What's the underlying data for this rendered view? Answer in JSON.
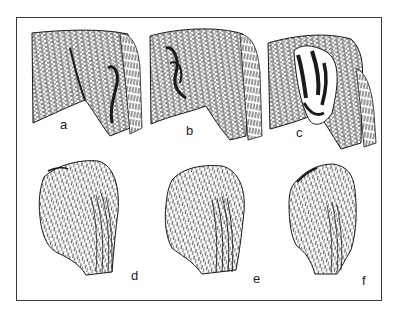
{
  "figure": {
    "panels": [
      {
        "id": "a",
        "label": "a",
        "view": "side",
        "description": "hindquarter side view with tail"
      },
      {
        "id": "b",
        "label": "b",
        "view": "side",
        "description": "hindquarter side view with tail, darker markings"
      },
      {
        "id": "c",
        "label": "c",
        "view": "side",
        "description": "hindquarter side view with tail, bold stripe markings"
      },
      {
        "id": "d",
        "label": "d",
        "view": "rear",
        "description": "hindquarter rear view with tail"
      },
      {
        "id": "e",
        "label": "e",
        "view": "rear",
        "description": "hindquarter rear view with tail"
      },
      {
        "id": "f",
        "label": "f",
        "view": "rear",
        "description": "hindquarter rear view with tail"
      }
    ],
    "caption": ""
  },
  "colors": {
    "ink": "#1a1a1a",
    "frame": "#3a3a3a",
    "background": "#ffffff"
  }
}
